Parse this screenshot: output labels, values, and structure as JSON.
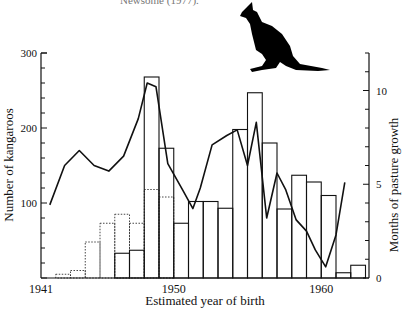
{
  "caption_fragment": "Newsome (1977).",
  "chart_data": {
    "type": "bar",
    "title": "",
    "xlabel": "Estimated year of birth",
    "ylabel": "Number of kangaroos",
    "y2label": "Months of pasture growth",
    "ylim": [
      0,
      300
    ],
    "y2lim": [
      0,
      12
    ],
    "x_ticks": [
      "1941",
      "1950",
      "1960"
    ],
    "y_ticks": [
      "100",
      "200",
      "300"
    ],
    "y2_ticks": [
      "0",
      "5",
      "10"
    ],
    "grid": false,
    "categories": [
      1942,
      1943,
      1944,
      1945,
      1946,
      1947,
      1948,
      1949,
      1950,
      1951,
      1952,
      1953,
      1954,
      1955,
      1956,
      1957,
      1958,
      1959,
      1960,
      1961,
      1962
    ],
    "series": [
      {
        "name": "Number of kangaroos (solid bars)",
        "style": "solid-bar",
        "values": [
          0,
          0,
          0,
          0,
          33,
          37,
          268,
          173,
          73,
          102,
          102,
          93,
          198,
          247,
          180,
          92,
          137,
          128,
          110,
          7,
          17
        ]
      },
      {
        "name": "Number of kangaroos (dotted bars)",
        "style": "dotted-bar",
        "values": [
          5,
          10,
          48,
          73,
          85,
          73,
          118,
          108,
          0,
          0,
          0,
          0,
          0,
          0,
          0,
          0,
          0,
          0,
          0,
          0,
          0
        ]
      },
      {
        "name": "Months of pasture growth",
        "style": "line",
        "axis": "right",
        "x": [
          1941.6,
          1942.6,
          1943.6,
          1944.6,
          1945.6,
          1946.6,
          1947.6,
          1948.2,
          1948.8,
          1949.6,
          1950.6,
          1951.3,
          1951.8,
          1952.6,
          1953.6,
          1954.3,
          1955.0,
          1955.6,
          1956.3,
          1957.0,
          1957.6,
          1958.3,
          1959.0,
          1959.6,
          1960.3,
          1961.0,
          1961.6
        ],
        "values": [
          3.9,
          6.0,
          6.8,
          6.0,
          5.7,
          6.5,
          8.5,
          10.4,
          10.2,
          6.1,
          4.7,
          3.7,
          4.8,
          7.1,
          7.6,
          7.9,
          6.0,
          8.3,
          3.2,
          5.6,
          4.7,
          3.1,
          2.5,
          1.5,
          0.6,
          2.3,
          5.1
        ]
      }
    ],
    "decoration": "kangaroo silhouette"
  }
}
